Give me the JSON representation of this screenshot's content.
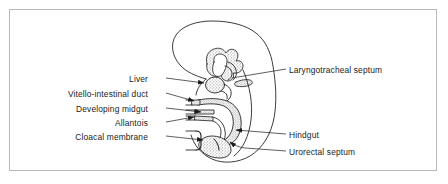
{
  "figure": {
    "frame_color": "#b9b9b9",
    "background_color": "#ffffff",
    "ink_color": "#1a1a1a",
    "stipple_color": "#9a9a9a"
  },
  "labels": {
    "left": [
      {
        "id": "liver",
        "text": "Liver",
        "x": 148,
        "y": 74
      },
      {
        "id": "vitello-intestinal-duct",
        "text": "Vitello-intestinal duct",
        "x": 148,
        "y": 90
      },
      {
        "id": "developing-midgut",
        "text": "Developing midgut",
        "x": 148,
        "y": 105
      },
      {
        "id": "allantois",
        "text": "Allantois",
        "x": 148,
        "y": 119
      },
      {
        "id": "cloacal-membrane",
        "text": "Cloacal membrane",
        "x": 148,
        "y": 133
      }
    ],
    "right": [
      {
        "id": "laryngotracheal-septum",
        "text": "Laryngotracheal septum",
        "x": 288,
        "y": 66
      },
      {
        "id": "hindgut",
        "text": "Hindgut",
        "x": 288,
        "y": 131
      },
      {
        "id": "urorectal-septum",
        "text": "Urorectal septum",
        "x": 288,
        "y": 148
      }
    ]
  },
  "leader_lines": {
    "liver": {
      "from": [
        166,
        78
      ],
      "to": [
        205,
        83
      ],
      "arrow": true
    },
    "vitello_intestinal_duct": {
      "from": [
        166,
        93
      ],
      "to": [
        196,
        101
      ],
      "arrow": true
    },
    "developing_midgut": {
      "from": [
        166,
        108
      ],
      "to": [
        203,
        112
      ],
      "arrow": true
    },
    "allantois": {
      "from": [
        166,
        122
      ],
      "to": [
        196,
        117
      ],
      "arrow": true
    },
    "cloacal_membrane": {
      "from": [
        166,
        136
      ],
      "to": [
        205,
        140
      ],
      "arrow": true
    },
    "laryngotracheal_septum": {
      "from": [
        286,
        70
      ],
      "to": [
        233,
        79
      ],
      "arrow": false
    },
    "hindgut": {
      "from": [
        286,
        134
      ],
      "to": [
        234,
        130
      ],
      "arrow": true
    },
    "urorectal_septum": {
      "from": [
        286,
        151
      ],
      "to": [
        232,
        142
      ],
      "arrow": true
    }
  },
  "anatomy": {
    "parts": [
      "embryo-body-outline",
      "head-outline",
      "pharynx-foregut",
      "laryngotracheal-septum-structure",
      "lung-bud",
      "liver-bud",
      "stomach",
      "midgut-loop",
      "vitello-intestinal-duct-tube",
      "hindgut-tube",
      "allantois-tube",
      "cloaca",
      "cloacal-membrane-structure",
      "urorectal-septum-structure"
    ]
  }
}
